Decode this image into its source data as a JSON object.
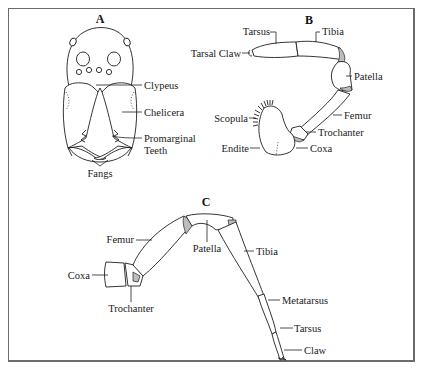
{
  "figure": {
    "panels": [
      {
        "id": "A",
        "title": "A",
        "subject": "spider-head-front-view",
        "labels": [
          "Clypeus",
          "Chelicera",
          "Promarginal",
          "Teeth",
          "Fangs"
        ]
      },
      {
        "id": "B",
        "title": "B",
        "subject": "pedipalp",
        "labels": [
          "Tarsus",
          "Tibia",
          "Tarsal Claw",
          "Patella",
          "Femur",
          "Scopula",
          "Trochanter",
          "Endite",
          "Coxa"
        ]
      },
      {
        "id": "C",
        "title": "C",
        "subject": "walking-leg",
        "labels": [
          "Femur",
          "Patella",
          "Tibia",
          "Coxa",
          "Trochanter",
          "Metatarsus",
          "Tarsus",
          "Claw"
        ]
      }
    ]
  },
  "A": {
    "title": "A",
    "clypeus": "Clypeus",
    "chelicera": "Chelicera",
    "promarginal": "Promarginal",
    "teeth": "Teeth",
    "fangs": "Fangs"
  },
  "B": {
    "title": "B",
    "tarsus": "Tarsus",
    "tibia": "Tibia",
    "tarsal_claw": "Tarsal Claw",
    "patella": "Patella",
    "femur": "Femur",
    "scopula": "Scopula",
    "trochanter": "Trochanter",
    "endite": "Endite",
    "coxa": "Coxa"
  },
  "C": {
    "title": "C",
    "femur": "Femur",
    "patella": "Patella",
    "tibia": "Tibia",
    "coxa": "Coxa",
    "trochanter": "Trochanter",
    "metatarsus": "Metatarsus",
    "tarsus": "Tarsus",
    "claw": "Claw"
  },
  "colors": {
    "background": "#ffffff",
    "ink": "#1e1e1e",
    "frame": "#6b6b6b",
    "shading": "#bdbdbd"
  }
}
